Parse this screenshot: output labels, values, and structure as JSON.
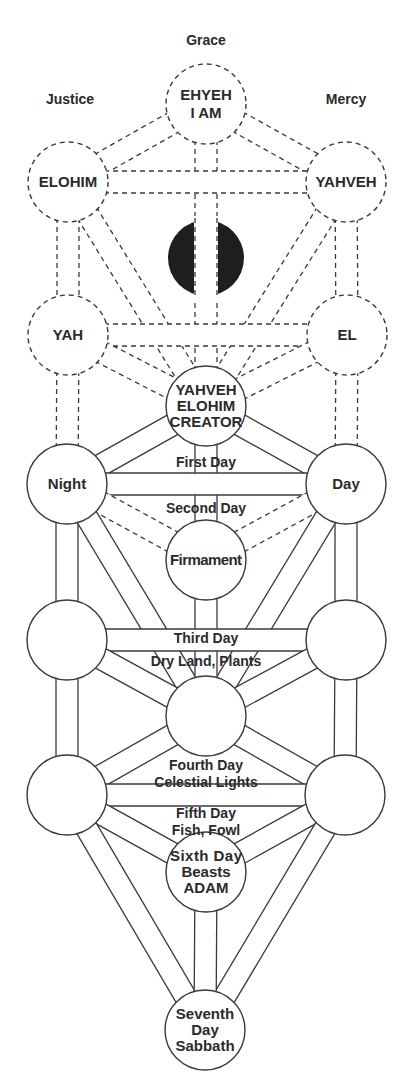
{
  "title_labels": {
    "top": "Grace",
    "left": "Justice",
    "right": "Mercy"
  },
  "nodes": [
    {
      "id": "ehyeh",
      "lines": [
        "EHYEH",
        "I AM"
      ],
      "cx": 206,
      "cy": 104,
      "r": 40,
      "style": "dashed"
    },
    {
      "id": "elohim",
      "lines": [
        "ELOHIM"
      ],
      "cx": 68,
      "cy": 182,
      "r": 40,
      "style": "dashed"
    },
    {
      "id": "yahveh",
      "lines": [
        "YAHVEH"
      ],
      "cx": 346,
      "cy": 182,
      "r": 40,
      "style": "dashed"
    },
    {
      "id": "daath",
      "lines": [],
      "cx": 206,
      "cy": 258,
      "r": 40,
      "style": "black-split"
    },
    {
      "id": "yah",
      "lines": [
        "YAH"
      ],
      "cx": 68,
      "cy": 335,
      "r": 40,
      "style": "dashed"
    },
    {
      "id": "el",
      "lines": [
        "EL"
      ],
      "cx": 347,
      "cy": 335,
      "r": 40,
      "style": "dashed"
    },
    {
      "id": "creator",
      "lines": [
        "YAHVEH",
        "ELOHIM",
        "CREATOR"
      ],
      "cx": 206,
      "cy": 406,
      "r": 40,
      "style": "solid"
    },
    {
      "id": "night",
      "lines": [
        "Night"
      ],
      "cx": 67,
      "cy": 484,
      "r": 40,
      "style": "solid"
    },
    {
      "id": "day",
      "lines": [
        "Day"
      ],
      "cx": 346,
      "cy": 484,
      "r": 40,
      "style": "solid"
    },
    {
      "id": "firmament",
      "lines": [
        "Firmament"
      ],
      "cx": 206,
      "cy": 560,
      "r": 40,
      "style": "solid"
    },
    {
      "id": "left3",
      "lines": [],
      "cx": 67,
      "cy": 640,
      "r": 40,
      "style": "solid"
    },
    {
      "id": "right3",
      "lines": [],
      "cx": 346,
      "cy": 640,
      "r": 40,
      "style": "solid"
    },
    {
      "id": "center4",
      "lines": [],
      "cx": 206,
      "cy": 716,
      "r": 40,
      "style": "solid"
    },
    {
      "id": "left5",
      "lines": [],
      "cx": 67,
      "cy": 795,
      "r": 40,
      "style": "solid"
    },
    {
      "id": "right5",
      "lines": [],
      "cx": 345,
      "cy": 795,
      "r": 40,
      "style": "solid"
    },
    {
      "id": "sixth",
      "lines": [
        "Sixth Day",
        "Beasts",
        "ADAM"
      ],
      "cx": 206,
      "cy": 872,
      "r": 40,
      "style": "solid"
    },
    {
      "id": "seventh",
      "lines": [
        "Seventh",
        "Day",
        "Sabbath"
      ],
      "cx": 205,
      "cy": 1030,
      "r": 40,
      "style": "solid"
    }
  ],
  "paths": [
    {
      "from": "ehyeh",
      "to": "elohim",
      "style": "dashed"
    },
    {
      "from": "ehyeh",
      "to": "yahveh",
      "style": "dashed"
    },
    {
      "from": "ehyeh",
      "to": "daath",
      "style": "dashed"
    },
    {
      "from": "elohim",
      "to": "yahveh",
      "style": "dashed"
    },
    {
      "from": "elohim",
      "to": "yah",
      "style": "dashed"
    },
    {
      "from": "yahveh",
      "to": "el",
      "style": "dashed"
    },
    {
      "from": "elohim",
      "to": "creator",
      "style": "dashed"
    },
    {
      "from": "yahveh",
      "to": "creator",
      "style": "dashed"
    },
    {
      "from": "daath",
      "to": "creator",
      "style": "dashed"
    },
    {
      "from": "yah",
      "to": "el",
      "style": "dashed"
    },
    {
      "from": "yah",
      "to": "creator",
      "style": "dashed"
    },
    {
      "from": "el",
      "to": "creator",
      "style": "dashed"
    },
    {
      "from": "yah",
      "to": "night",
      "style": "dashed"
    },
    {
      "from": "el",
      "to": "day",
      "style": "dashed"
    },
    {
      "from": "creator",
      "to": "night",
      "style": "solid"
    },
    {
      "from": "creator",
      "to": "day",
      "style": "solid"
    },
    {
      "from": "creator",
      "to": "firmament",
      "style": "solid"
    },
    {
      "from": "night",
      "to": "day",
      "style": "solid"
    },
    {
      "from": "night",
      "to": "firmament",
      "style": "dashed"
    },
    {
      "from": "day",
      "to": "firmament",
      "style": "dashed"
    },
    {
      "from": "night",
      "to": "left3",
      "style": "solid"
    },
    {
      "from": "day",
      "to": "right3",
      "style": "solid"
    },
    {
      "from": "night",
      "to": "center4",
      "style": "solid"
    },
    {
      "from": "day",
      "to": "center4",
      "style": "solid"
    },
    {
      "from": "firmament",
      "to": "center4",
      "style": "solid"
    },
    {
      "from": "left3",
      "to": "right3",
      "style": "solid"
    },
    {
      "from": "left3",
      "to": "center4",
      "style": "solid"
    },
    {
      "from": "right3",
      "to": "center4",
      "style": "solid"
    },
    {
      "from": "left3",
      "to": "left5",
      "style": "solid"
    },
    {
      "from": "right3",
      "to": "right5",
      "style": "solid"
    },
    {
      "from": "center4",
      "to": "left5",
      "style": "solid"
    },
    {
      "from": "center4",
      "to": "right5",
      "style": "solid"
    },
    {
      "from": "left5",
      "to": "right5",
      "style": "solid"
    },
    {
      "from": "left5",
      "to": "sixth",
      "style": "solid"
    },
    {
      "from": "right5",
      "to": "sixth",
      "style": "solid"
    },
    {
      "from": "left5",
      "to": "seventh",
      "style": "solid"
    },
    {
      "from": "right5",
      "to": "seventh",
      "style": "solid"
    },
    {
      "from": "sixth",
      "to": "seventh",
      "style": "solid"
    }
  ],
  "path_labels": [
    {
      "text": "First Day",
      "x": 206,
      "y": 467
    },
    {
      "text": "Second Day",
      "x": 206,
      "y": 513
    },
    {
      "text": "Third Day",
      "x": 206,
      "y": 643
    },
    {
      "text": "Dry Land, Plants",
      "x": 206,
      "y": 666
    },
    {
      "text": "Fourth Day",
      "x": 206,
      "y": 770
    },
    {
      "text": "Celestial Lights",
      "x": 206,
      "y": 787
    },
    {
      "text": "Fifth Day",
      "x": 206,
      "y": 818
    },
    {
      "text": "Fish, Fowl",
      "x": 206,
      "y": 835
    }
  ],
  "colors": {
    "line": "#3a3a3a",
    "text": "#2a2a2a",
    "daath_fill": "#1e1e1e",
    "background": "#ffffff"
  }
}
